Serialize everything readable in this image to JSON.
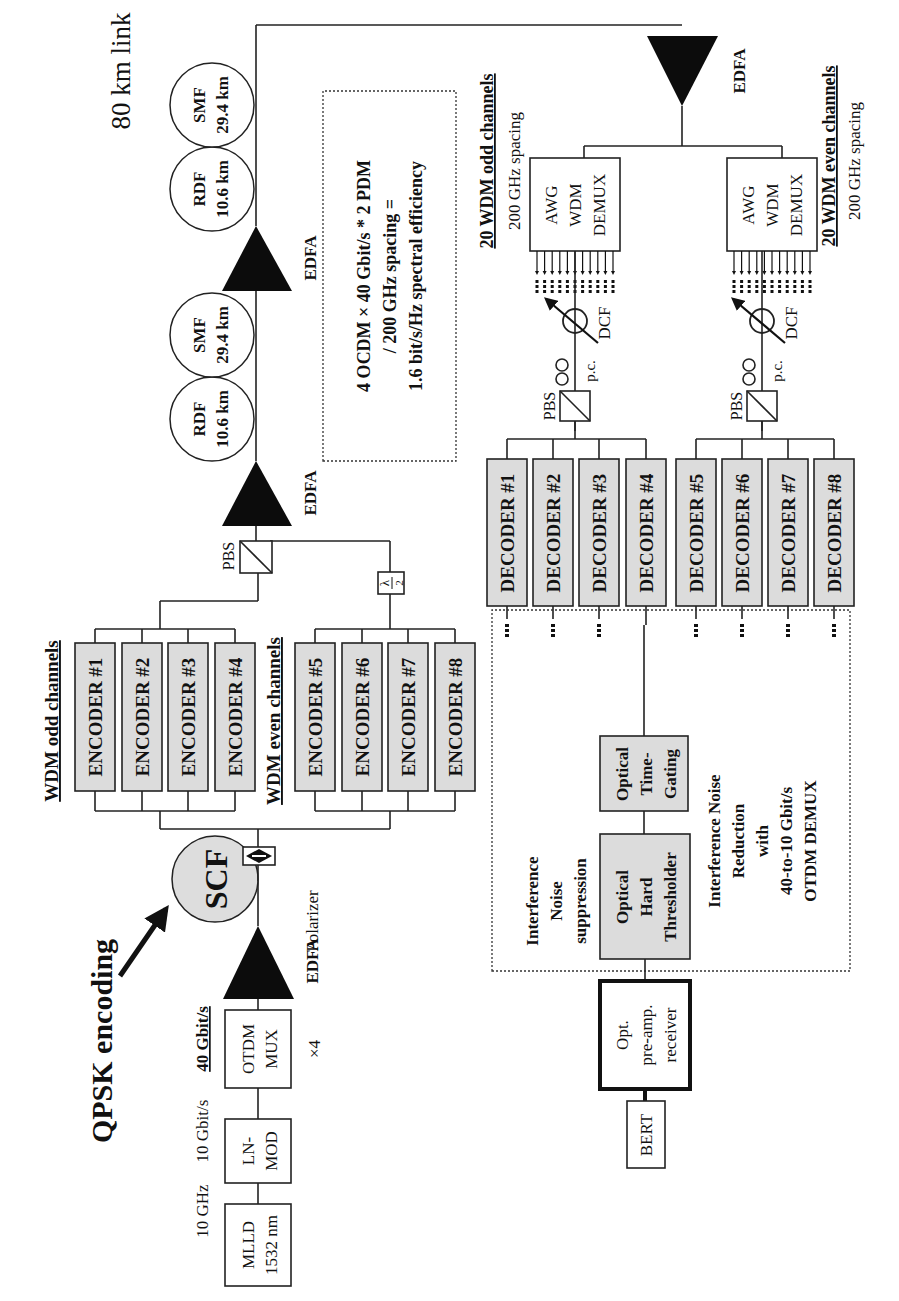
{
  "diagram": {
    "title": "80 km link",
    "transmitter": {
      "source_label_top": "10 GHz",
      "source_box": [
        "MLLD",
        "1532 nm"
      ],
      "modulator_rate": "10 Gbit/s",
      "modulator_box": [
        "LN-",
        "MOD"
      ],
      "mux_rate": "40 Gbit/s",
      "mux_box": [
        "OTDM",
        "MUX"
      ],
      "mux_multiplier": "×4",
      "amplifier": "EDFA",
      "scf": "SCF",
      "polarizer": "Polarizer",
      "qpsk_label": "QPSK encoding"
    },
    "encoders": {
      "odd_group_label": "WDM odd channels",
      "even_group_label": "WDM even channels",
      "items": [
        "ENCODER #1",
        "ENCODER #2",
        "ENCODER #3",
        "ENCODER #4",
        "ENCODER #5",
        "ENCODER #6",
        "ENCODER #7",
        "ENCODER #8"
      ],
      "half_wave_plate": [
        "λ",
        "2"
      ],
      "pbs": "PBS"
    },
    "link": {
      "spans": [
        {
          "amp": "EDFA",
          "rdf": [
            "RDF",
            "10.6 km"
          ],
          "smf": [
            "SMF",
            "29.4 km"
          ]
        },
        {
          "amp": "EDFA",
          "rdf": [
            "RDF",
            "10.6 km"
          ],
          "smf": [
            "SMF",
            "29.4 km"
          ]
        }
      ],
      "efficiency_note": [
        "4 OCDM × 40 Gbit/s * 2 PDM",
        "/ 200 GHz spacing =",
        "1.6 bit/s/Hz spectral efficiency"
      ]
    },
    "receiver": {
      "amplifier": "EDFA",
      "odd": {
        "label": "20 WDM odd channels",
        "spacing": "200 GHz spacing",
        "demux": [
          "AWG",
          "WDM",
          "DEMUX"
        ],
        "pc": "p.c.",
        "dcf": "DCF",
        "pbs": "PBS"
      },
      "even": {
        "label": "20 WDM even channels",
        "spacing": "200 GHz spacing",
        "demux": [
          "AWG",
          "WDM",
          "DEMUX"
        ],
        "pc": "p.c.",
        "dcf": "DCF",
        "pbs": "PBS"
      },
      "decoders": [
        "DECODER #1",
        "DECODER #2",
        "DECODER #3",
        "DECODER #4",
        "DECODER #5",
        "DECODER #6",
        "DECODER #7",
        "DECODER #8"
      ],
      "time_gating": [
        "Optical",
        "Time-",
        "Gating"
      ],
      "thresholder": [
        "Optical",
        "Hard",
        "Thresholder"
      ],
      "suppression_label": [
        "Interference",
        "Noise",
        "suppression"
      ],
      "reduction_label": [
        "Interference Noise",
        "Reduction",
        "with",
        "40-to-10 Gbit/s",
        "OTDM DEMUX"
      ],
      "preamp": [
        "Opt.",
        "pre-amp.",
        "receiver"
      ],
      "bert": "BERT"
    }
  }
}
